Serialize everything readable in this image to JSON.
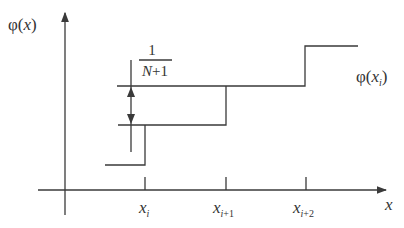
{
  "diagram": {
    "type": "step-function",
    "y_axis_label": "φ(x)",
    "x_axis_label": "x",
    "curve_label": "φ(x_i)",
    "step_height_label": {
      "numerator": "1",
      "denominator": "N+1"
    },
    "ticks": [
      {
        "base": "x",
        "sub": "i"
      },
      {
        "base": "x",
        "sub": "i+1"
      },
      {
        "base": "x",
        "sub": "i+2"
      }
    ],
    "colors": {
      "line": "#3a3a3a",
      "text": "#333333",
      "background": "#ffffff"
    }
  }
}
